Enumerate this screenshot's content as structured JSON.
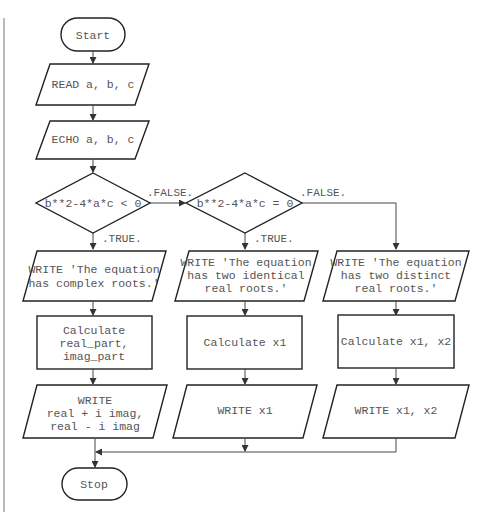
{
  "diagram": {
    "type": "flowchart",
    "nodes": {
      "start": {
        "label": "Start",
        "shape": "terminal"
      },
      "read": {
        "label": "READ a, b, c",
        "shape": "io"
      },
      "echo": {
        "label": "ECHO a, b, c",
        "shape": "io"
      },
      "decision1": {
        "label": "b**2-4*a*c < 0",
        "shape": "decision"
      },
      "decision2": {
        "label": "b**2-4*a*c = 0",
        "shape": "decision"
      },
      "write_complex": {
        "lines": [
          "WRITE 'The equation",
          "has complex roots.'"
        ],
        "shape": "io"
      },
      "write_identical": {
        "lines": [
          "WRITE 'The equation",
          "has two identical",
          "real roots.'"
        ],
        "shape": "io"
      },
      "write_distinct": {
        "lines": [
          "WRITE 'The equation",
          "has two distinct",
          "real roots.'"
        ],
        "shape": "io"
      },
      "calc_complex": {
        "lines": [
          "Calculate",
          "real_part,",
          "imag_part"
        ],
        "shape": "process"
      },
      "calc_x1": {
        "label": "Calculate x1",
        "shape": "process"
      },
      "calc_x1x2": {
        "label": "Calculate x1, x2",
        "shape": "process"
      },
      "out_complex": {
        "lines": [
          "WRITE",
          "real + i imag,",
          "real - i imag"
        ],
        "shape": "io"
      },
      "out_x1": {
        "label": "WRITE x1",
        "shape": "io"
      },
      "out_x1x2": {
        "label": "WRITE x1, x2",
        "shape": "io"
      },
      "stop": {
        "label": "Stop",
        "shape": "terminal"
      }
    },
    "edge_labels": {
      "d1_false": ".FALSE.",
      "d1_true": ".TRUE.",
      "d2_false": ".FALSE.",
      "d2_true": ".TRUE."
    },
    "edges": [
      {
        "from": "start",
        "to": "read"
      },
      {
        "from": "read",
        "to": "echo"
      },
      {
        "from": "echo",
        "to": "decision1"
      },
      {
        "from": "decision1",
        "to": "write_complex",
        "label": ".TRUE."
      },
      {
        "from": "decision1",
        "to": "decision2",
        "label": ".FALSE."
      },
      {
        "from": "decision2",
        "to": "write_identical",
        "label": ".TRUE."
      },
      {
        "from": "decision2",
        "to": "write_distinct",
        "label": ".FALSE."
      },
      {
        "from": "write_complex",
        "to": "calc_complex"
      },
      {
        "from": "write_identical",
        "to": "calc_x1"
      },
      {
        "from": "write_distinct",
        "to": "calc_x1x2"
      },
      {
        "from": "calc_complex",
        "to": "out_complex"
      },
      {
        "from": "calc_x1",
        "to": "out_x1"
      },
      {
        "from": "calc_x1x2",
        "to": "out_x1x2"
      },
      {
        "from": "out_complex",
        "to": "stop"
      },
      {
        "from": "out_x1",
        "to": "stop"
      },
      {
        "from": "out_x1x2",
        "to": "stop"
      }
    ]
  }
}
